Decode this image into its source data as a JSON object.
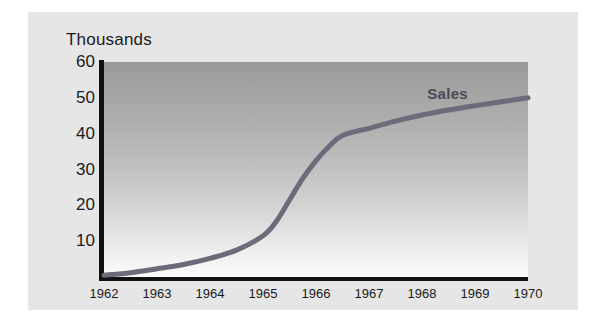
{
  "figure": {
    "title": "Thousands",
    "series_label": "Sales",
    "curve_color": "#6b6b7a",
    "plot_bg_top": "#9a9a9a",
    "plot_bg_bottom": "#fbfbfb",
    "card_bg": "#e6e6e6",
    "axis_color": "#121212"
  },
  "chart_data": {
    "type": "line",
    "title": "Thousands",
    "xlabel": "",
    "ylabel": "Thousands",
    "xlim": [
      1962,
      1970
    ],
    "ylim": [
      0,
      60
    ],
    "grid": false,
    "legend": "inline-label",
    "yticks": [
      10,
      20,
      30,
      40,
      50,
      60
    ],
    "xticks": [
      "1962",
      "1963",
      "1964",
      "1965",
      "1966",
      "1967",
      "1968",
      "1969",
      "1970"
    ],
    "series": [
      {
        "name": "Sales",
        "color": "#6b6b7a",
        "x": [
          1962,
          1962.5,
          1963,
          1963.5,
          1964,
          1964.5,
          1965,
          1965.25,
          1965.5,
          1965.75,
          1966,
          1966.25,
          1966.5,
          1967,
          1967.5,
          1968,
          1968.5,
          1969,
          1969.5,
          1970
        ],
        "values": [
          0.5,
          1.2,
          2.3,
          3.5,
          5.2,
          7.5,
          11.5,
          15.5,
          21.5,
          27.5,
          32.5,
          36.5,
          39.5,
          41.5,
          43.5,
          45.2,
          46.6,
          47.8,
          48.9,
          50.0
        ]
      }
    ],
    "annotations": [
      {
        "text": "Sales",
        "x": 1968.1,
        "y": 53.5,
        "bold": true
      }
    ]
  }
}
